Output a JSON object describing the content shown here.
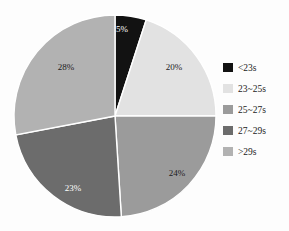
{
  "chart_data": {
    "type": "pie",
    "title": "",
    "subtitle": "",
    "xlabel": "",
    "ylabel": "",
    "grid": false,
    "legend_position": "right",
    "start_angle_deg": 0,
    "direction": "clockwise",
    "center": {
      "cx": 115,
      "cy": 116,
      "r": 101
    },
    "categories": [
      "<23s",
      "23~25s",
      "25~27s",
      "27~29s",
      ">29s"
    ],
    "values": [
      5,
      20,
      24,
      23,
      28
    ],
    "value_labels": [
      "5%",
      "20%",
      "24%",
      "23%",
      "28%"
    ],
    "colors": [
      "#121212",
      "#e2e2e2",
      "#9b9b9b",
      "#6c6c6c",
      "#b2b2b2"
    ],
    "label_text_colors": [
      "#ffffff",
      "#1b1b1b",
      "#1b1b1b",
      "#ffffff",
      "#1b1b1b"
    ],
    "slice_label_positions": [
      {
        "x": 122,
        "y": 29
      },
      {
        "x": 174,
        "y": 67
      },
      {
        "x": 177,
        "y": 173
      },
      {
        "x": 73,
        "y": 188
      },
      {
        "x": 66,
        "y": 67
      }
    ],
    "slices": [
      {
        "label": "<23s",
        "value": 5,
        "display": "5%",
        "color": "#121212"
      },
      {
        "label": "23~25s",
        "value": 20,
        "display": "20%",
        "color": "#e2e2e2"
      },
      {
        "label": "25~27s",
        "value": 24,
        "display": "24%",
        "color": "#9b9b9b"
      },
      {
        "label": "27~29s",
        "value": 23,
        "display": "23%",
        "color": "#6c6c6c"
      },
      {
        "label": ">29s",
        "value": 28,
        "display": "28%",
        "color": "#b2b2b2"
      }
    ],
    "slice_separator_color": "#ffffff"
  },
  "legend": {
    "items": [
      {
        "label": "<23s",
        "color": "#121212"
      },
      {
        "label": "23~25s",
        "color": "#e2e2e2"
      },
      {
        "label": "25~27s",
        "color": "#9b9b9b"
      },
      {
        "label": "27~29s",
        "color": "#6c6c6c"
      },
      {
        "label": ">29s",
        "color": "#b2b2b2"
      }
    ]
  }
}
